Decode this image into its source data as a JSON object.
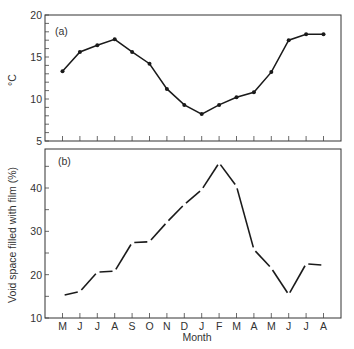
{
  "chart_data": [
    {
      "type": "line",
      "panel_label": "(a)",
      "title": "",
      "xlabel": "",
      "ylabel": "°C",
      "ylim": [
        5,
        20
      ],
      "yticks": [
        5,
        10,
        15,
        20
      ],
      "y_minor_step": 1,
      "grid": false,
      "markers": true,
      "categories": [
        "M",
        "J",
        "J",
        "A",
        "S",
        "O",
        "N",
        "D",
        "J",
        "F",
        "M",
        "A",
        "M",
        "J",
        "J",
        "A"
      ],
      "values": [
        13.3,
        15.6,
        16.4,
        17.1,
        15.6,
        14.2,
        11.2,
        9.3,
        8.2,
        9.3,
        10.2,
        10.8,
        13.2,
        17.0,
        17.7,
        17.7
      ]
    },
    {
      "type": "line",
      "panel_label": "(b)",
      "title": "",
      "xlabel": "Month",
      "ylabel": "Void space filled with film (%)",
      "ylim": [
        10,
        49
      ],
      "yticks": [
        10,
        20,
        30,
        40
      ],
      "y_minor_step": 5,
      "grid": false,
      "markers": false,
      "line_style": "segments with gaps at data points",
      "categories": [
        "M",
        "J",
        "J",
        "A",
        "S",
        "O",
        "N",
        "D",
        "J",
        "F",
        "M",
        "A",
        "M",
        "J",
        "J",
        "A"
      ],
      "values": [
        15.2,
        16.1,
        20.6,
        20.8,
        27.4,
        27.6,
        32.1,
        36.2,
        39.6,
        45.8,
        40.4,
        25.8,
        21.5,
        15.4,
        22.5,
        22.2
      ]
    }
  ],
  "panels": {
    "a": {
      "label": "(a)",
      "ylabel": "°C"
    },
    "b": {
      "label": "(b)",
      "ylabel": "Void space filled with film (%)"
    }
  },
  "xaxis": {
    "label": "Month",
    "tick_labels": [
      "M",
      "J",
      "J",
      "A",
      "S",
      "O",
      "N",
      "D",
      "J",
      "F",
      "M",
      "A",
      "M",
      "J",
      "J",
      "A"
    ]
  }
}
